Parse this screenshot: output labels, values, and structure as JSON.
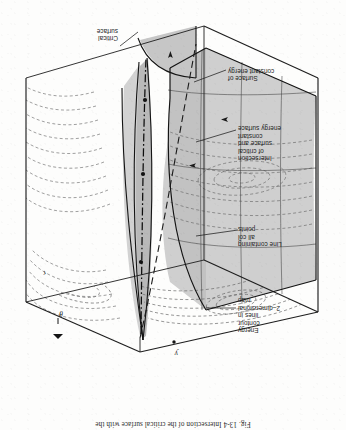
{
  "figure": {
    "caption_prefix": "Fig. 13-4",
    "caption_text": "Intersection of the critical surface with the",
    "caption_full": "Fig. 13-4   Intersection of the critical surface with the",
    "orientation": "rotated-180",
    "ink_color": "#1c1c1c",
    "shade_color": "#c9c9c9",
    "shade_color_dark": "#b0b0b0",
    "paper_color": "#fdfdfc"
  },
  "axes": [
    {
      "name": "axis-label-y",
      "symbol": "y"
    },
    {
      "name": "axis-label-theta",
      "symbol": "θ"
    },
    {
      "name": "axis-label-r",
      "symbol": "r"
    }
  ],
  "annotations": [
    {
      "name": "energy-contour-lines",
      "lines": [
        "Energy",
        "contour",
        "lines in",
        "2–dimensional",
        "map"
      ],
      "text": "Energy contour lines in 2-dimensional map"
    },
    {
      "name": "line-containing-all-col-points",
      "lines": [
        "Line containing",
        "all col",
        "points"
      ],
      "text": "Line containing all col points"
    },
    {
      "name": "intersection-of-critical-surface",
      "lines": [
        "Intersection",
        "of critical",
        "surface and",
        "constant",
        "energy surface"
      ],
      "text": "Intersection of critical surface and constant energy surface"
    },
    {
      "name": "surface-of-constant-energy",
      "lines": [
        "Surface of",
        "constant energy"
      ],
      "text": "Surface of constant energy"
    },
    {
      "name": "critical-surface",
      "lines": [
        "Critical",
        "surface"
      ],
      "text": "Critical surface"
    }
  ]
}
